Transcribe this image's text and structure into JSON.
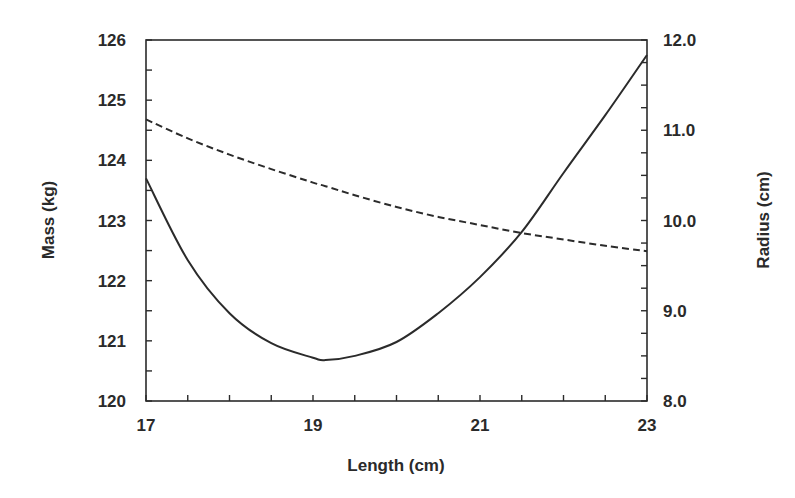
{
  "chart_data": {
    "type": "line",
    "title": "",
    "xlabel": "Length (cm)",
    "ylabel": "Mass (kg)",
    "y2label": "Radius (cm)",
    "xlim": [
      17,
      23
    ],
    "ylim": [
      120,
      126
    ],
    "y2lim": [
      8.0,
      12.0
    ],
    "x_ticks": [
      "17",
      "19",
      "21",
      "23"
    ],
    "x_tick_values": [
      17,
      19,
      21,
      23
    ],
    "x_minor_step": 0.5,
    "y_ticks": [
      "120",
      "121",
      "122",
      "123",
      "124",
      "125",
      "126"
    ],
    "y_tick_values": [
      120,
      121,
      122,
      123,
      124,
      125,
      126
    ],
    "y_minor_step": 0.5,
    "y2_ticks": [
      "8.0",
      "9.0",
      "10.0",
      "11.0",
      "12.0"
    ],
    "y2_tick_values": [
      8,
      9,
      10,
      11,
      12
    ],
    "y2_minor_step": 0.25,
    "grid": false,
    "legend": null,
    "x": [
      17.0,
      17.5,
      18.0,
      18.5,
      19.0,
      19.15,
      19.5,
      20.0,
      20.5,
      21.0,
      21.5,
      22.0,
      22.5,
      23.0
    ],
    "series": [
      {
        "name": "Mass",
        "axis": "left",
        "style": "solid",
        "values": [
          123.7,
          122.34,
          121.46,
          120.96,
          120.72,
          120.68,
          120.75,
          120.98,
          121.46,
          122.06,
          122.81,
          123.79,
          124.75,
          125.75
        ]
      },
      {
        "name": "Radius",
        "axis": "right",
        "style": "dashed",
        "values": [
          11.12,
          10.91,
          10.73,
          10.57,
          10.42,
          10.38,
          10.28,
          10.15,
          10.04,
          9.95,
          9.86,
          9.79,
          9.72,
          9.66
        ]
      }
    ],
    "annotations": []
  },
  "colors": {
    "line": "#2b2b2b",
    "axis": "#2b2b2b",
    "text": "#2a2a2a",
    "background": "#ffffff"
  }
}
